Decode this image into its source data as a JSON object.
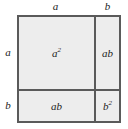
{
  "diagram": {
    "identity": "(a + b)² = a² + 2ab + b²",
    "colors": {
      "cell_fill": "#ededed",
      "line": "#5a5a5a",
      "text": "#1c1c1c",
      "background": "#ffffff"
    },
    "dimensions": {
      "top": [
        {
          "label": "a",
          "segment": "wide"
        },
        {
          "label": "b",
          "segment": "narrow"
        }
      ],
      "left": [
        {
          "label": "a",
          "segment": "tall"
        },
        {
          "label": "b",
          "segment": "short"
        }
      ]
    },
    "regions": [
      {
        "id": "a-squared",
        "base": "a",
        "exponent": "2",
        "position": "top-left"
      },
      {
        "id": "ab-right",
        "base": "ab",
        "exponent": "",
        "position": "top-right"
      },
      {
        "id": "ab-bottom",
        "base": "ab",
        "exponent": "",
        "position": "bottom-left"
      },
      {
        "id": "b-squared",
        "base": "b",
        "exponent": "2",
        "position": "bottom-right"
      }
    ]
  },
  "chart_data": {
    "type": "diagram",
    "categories": [
      "a²",
      "ab",
      "ab",
      "b²"
    ],
    "values": [
      1,
      1,
      1,
      1
    ]
  }
}
